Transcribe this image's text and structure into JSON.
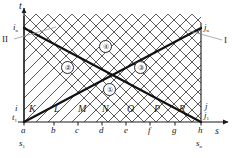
{
  "figure": {
    "type": "characteristics-lattice-diagram",
    "axes": {
      "x_axis_label": "s",
      "y_axis_label": "t",
      "x_ticks": [
        "a",
        "b",
        "c",
        "d",
        "e",
        "f",
        "g",
        "h"
      ],
      "x_tick_positions": [
        24,
        54,
        78,
        102,
        126,
        150,
        175,
        201
      ],
      "x_range_start_label": "s",
      "x_range_start_sub": "1",
      "x_range_end_label": "s",
      "x_range_end_sub": "n"
    },
    "boundaries": {
      "left_bottom": {
        "text": "i",
        "sub": ""
      },
      "left_top": {
        "text": "i",
        "sub": "n"
      },
      "left_origin": {
        "text": "t",
        "sub": "1"
      },
      "right_bottom": {
        "text": "j",
        "sub": ""
      },
      "right_top": {
        "text": "j",
        "sub": "n"
      },
      "right_origin": {
        "text": "j",
        "sub": "1"
      }
    },
    "leaders": {
      "left": {
        "label": "II"
      },
      "right": {
        "label": "I"
      }
    },
    "nodes": [
      {
        "label": "K",
        "x": 33,
        "y": 110
      },
      {
        "label": "L",
        "x": 58,
        "y": 110
      },
      {
        "label": "M",
        "x": 82,
        "y": 110
      },
      {
        "label": "N",
        "x": 106,
        "y": 110
      },
      {
        "label": "O",
        "x": 131,
        "y": 110
      },
      {
        "label": "P",
        "x": 158,
        "y": 110
      },
      {
        "label": "R",
        "x": 183,
        "y": 110
      }
    ],
    "regions": [
      {
        "id": "1",
        "glyph": "①",
        "x": 108,
        "y": 88
      },
      {
        "id": "2",
        "glyph": "②",
        "x": 66,
        "y": 66
      },
      {
        "id": "3",
        "glyph": "③",
        "x": 139,
        "y": 66
      },
      {
        "id": "4",
        "glyph": "④",
        "x": 104,
        "y": 45
      }
    ],
    "colors": {
      "line": "#262626",
      "thick_line": "#111111",
      "lattice": "#3d3d3d",
      "leader": "#8a8a8a",
      "text": "#1a1a1a"
    },
    "lattice": {
      "spacing": 24,
      "plot_left": 24,
      "plot_right": 201,
      "plot_top": 28,
      "plot_bottom": 122
    }
  }
}
